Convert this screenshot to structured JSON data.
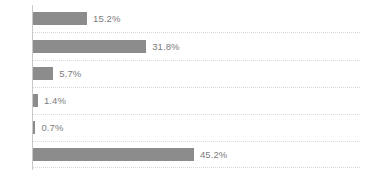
{
  "chart_data": {
    "type": "bar",
    "orientation": "horizontal",
    "title": "",
    "subtitle": "",
    "xlabel": "",
    "ylabel": "",
    "categories": [
      "",
      "",
      "",
      "",
      "",
      ""
    ],
    "values": [
      15.2,
      31.8,
      5.7,
      1.4,
      0.7,
      45.2
    ],
    "data_labels": [
      "15.2%",
      "31.8%",
      "5.7%",
      "1.4%",
      "0.7%",
      "45.2%"
    ],
    "value_suffix": "%",
    "xlim": [
      0,
      100
    ],
    "grid": true,
    "grid_style": "dotted-horizontal",
    "legend": "none",
    "tick_labels": [],
    "annotations": [],
    "px_per_unit": 3.56,
    "colors": {
      "bar": "#8c8c8c",
      "label_text": "#7d7d7d",
      "gridline": "#d8d8d8",
      "axis_line": "#c9c9c9",
      "background": "#ffffff"
    },
    "rows": [
      {
        "index": 0,
        "label": "15.2%",
        "value": 15.2,
        "top": 12,
        "gridline_y": 32
      },
      {
        "index": 1,
        "label": "31.8%",
        "value": 31.8,
        "top": 40,
        "gridline_y": 60
      },
      {
        "index": 2,
        "label": "5.7%",
        "value": 5.7,
        "top": 67,
        "gridline_y": 87
      },
      {
        "index": 3,
        "label": "1.4%",
        "value": 1.4,
        "top": 94,
        "gridline_y": 114
      },
      {
        "index": 4,
        "label": "0.7%",
        "value": 0.7,
        "top": 121,
        "gridline_y": 141
      },
      {
        "index": 5,
        "label": "45.2%",
        "value": 45.2,
        "top": 148,
        "gridline_y": 167
      }
    ]
  }
}
